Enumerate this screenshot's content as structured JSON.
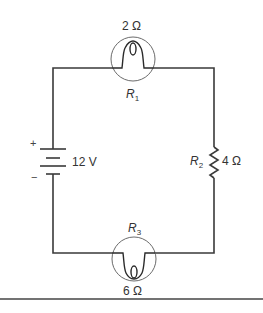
{
  "figure": {
    "type": "series circuit schematic",
    "components": {
      "r1": {
        "kind": "lamp",
        "symbol": "R",
        "subscript": "1",
        "value": "2 Ω",
        "position": "top"
      },
      "r2": {
        "kind": "resistor",
        "symbol": "R",
        "subscript": "2",
        "value": "4 Ω",
        "position": "right"
      },
      "r3": {
        "kind": "lamp",
        "symbol": "R",
        "subscript": "3",
        "value": "6 Ω",
        "position": "bottom"
      },
      "battery": {
        "kind": "battery",
        "value": "12 V",
        "plus_sign": "+",
        "minus_sign": "−",
        "position": "left"
      }
    },
    "colors": {
      "stroke": "#3a3a3a",
      "text": "#333333",
      "background": "#ffffff"
    }
  }
}
